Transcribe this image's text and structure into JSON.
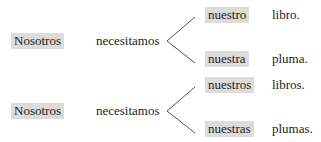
{
  "rows": [
    {
      "subject": "Nosotros",
      "verb": "necesitamos",
      "branches": [
        {
          "possessive": "nuestro",
          "noun": "libro."
        },
        {
          "possessive": "nuestra",
          "noun": "pluma."
        }
      ]
    },
    {
      "subject": "Nosotros",
      "verb": "necesitamos",
      "branches": [
        {
          "possessive": "nuestros",
          "noun": "libros."
        },
        {
          "possessive": "nuestras",
          "noun": "plumas."
        }
      ]
    }
  ],
  "colors": {
    "highlight": "#dcdcdc",
    "text": "#222222",
    "bracket_line": "#555555"
  }
}
